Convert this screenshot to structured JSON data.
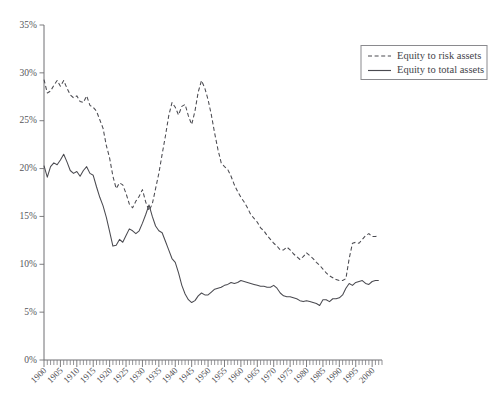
{
  "chart_data": {
    "type": "line",
    "title": "",
    "xlabel": "",
    "ylabel": "",
    "grid": false,
    "legend_position": "top-right",
    "xlim": [
      1900,
      2003
    ],
    "ylim": [
      0,
      35
    ],
    "y_ticks": [
      0,
      5,
      10,
      15,
      20,
      25,
      30,
      35
    ],
    "y_tick_labels": [
      "0%",
      "5%",
      "10%",
      "15%",
      "20%",
      "25%",
      "30%",
      "35%"
    ],
    "x_ticks": [
      1900,
      1905,
      1910,
      1915,
      1920,
      1925,
      1930,
      1935,
      1940,
      1945,
      1950,
      1955,
      1960,
      1965,
      1970,
      1975,
      1980,
      1985,
      1990,
      1995,
      2000
    ],
    "x_tick_labels": [
      "1900",
      "1905",
      "1910",
      "1915",
      "1920",
      "1925",
      "1930",
      "1935",
      "1940",
      "1945",
      "1950",
      "1955",
      "1960",
      "1965",
      "1970",
      "1975",
      "1980",
      "1985",
      "1990",
      "1995",
      "2000"
    ],
    "x_minor_tick_step": 1,
    "series": [
      {
        "name": "Equity to risk assets",
        "style": "dashed",
        "color": "#4a4a50",
        "x": [
          1900,
          1901,
          1902,
          1903,
          1904,
          1905,
          1906,
          1907,
          1908,
          1909,
          1910,
          1911,
          1912,
          1913,
          1914,
          1915,
          1916,
          1917,
          1918,
          1919,
          1920,
          1921,
          1922,
          1923,
          1924,
          1925,
          1926,
          1927,
          1928,
          1929,
          1930,
          1931,
          1932,
          1933,
          1934,
          1935,
          1936,
          1937,
          1938,
          1939,
          1940,
          1941,
          1942,
          1943,
          1944,
          1945,
          1946,
          1947,
          1948,
          1949,
          1950,
          1951,
          1952,
          1953,
          1954,
          1955,
          1956,
          1957,
          1958,
          1959,
          1960,
          1961,
          1962,
          1963,
          1964,
          1965,
          1966,
          1967,
          1968,
          1969,
          1970,
          1971,
          1972,
          1973,
          1974,
          1975,
          1976,
          1977,
          1978,
          1979,
          1980,
          1981,
          1982,
          1983,
          1984,
          1985,
          1986,
          1987,
          1988,
          1989,
          1990,
          1991,
          1992,
          1993,
          1994,
          1995,
          1996,
          1997,
          1998,
          1999,
          2000,
          2001,
          2002
        ],
        "values": [
          29.3,
          27.9,
          28.1,
          28.7,
          29.2,
          28.6,
          29.2,
          28.4,
          27.7,
          27.4,
          27.6,
          27.0,
          26.9,
          27.6,
          26.6,
          26.4,
          26.0,
          25.1,
          24.2,
          22.4,
          21.1,
          19.2,
          17.9,
          18.5,
          18.3,
          17.4,
          16.3,
          15.9,
          16.6,
          17.1,
          17.8,
          16.5,
          15.6,
          16.3,
          17.9,
          19.5,
          21.5,
          23.4,
          25.5,
          26.9,
          26.4,
          25.6,
          26.5,
          26.7,
          25.5,
          24.6,
          26.0,
          28.0,
          29.2,
          28.4,
          27.2,
          25.6,
          23.7,
          22.0,
          20.6,
          20.2,
          19.9,
          19.2,
          18.3,
          17.6,
          17.0,
          16.5,
          15.9,
          15.2,
          14.8,
          14.4,
          13.8,
          13.5,
          13.0,
          12.6,
          12.2,
          11.9,
          11.5,
          11.5,
          11.8,
          11.5,
          11.1,
          10.8,
          10.5,
          10.8,
          11.2,
          10.9,
          10.6,
          10.2,
          9.9,
          9.5,
          9.1,
          8.8,
          8.6,
          8.4,
          8.3,
          8.3,
          8.5,
          10.6,
          12.2,
          12.3,
          12.2,
          12.6,
          13.0,
          13.2,
          12.9,
          12.9,
          13.0
        ]
      },
      {
        "name": "Equity to total assets",
        "style": "solid",
        "color": "#4a4a50",
        "x": [
          1900,
          1901,
          1902,
          1903,
          1904,
          1905,
          1906,
          1907,
          1908,
          1909,
          1910,
          1911,
          1912,
          1913,
          1914,
          1915,
          1916,
          1917,
          1918,
          1919,
          1920,
          1921,
          1922,
          1923,
          1924,
          1925,
          1926,
          1927,
          1928,
          1929,
          1930,
          1931,
          1932,
          1933,
          1934,
          1935,
          1936,
          1937,
          1938,
          1939,
          1940,
          1941,
          1942,
          1943,
          1944,
          1945,
          1946,
          1947,
          1948,
          1949,
          1950,
          1951,
          1952,
          1953,
          1954,
          1955,
          1956,
          1957,
          1958,
          1959,
          1960,
          1961,
          1962,
          1963,
          1964,
          1965,
          1966,
          1967,
          1968,
          1969,
          1970,
          1971,
          1972,
          1973,
          1974,
          1975,
          1976,
          1977,
          1978,
          1979,
          1980,
          1981,
          1982,
          1983,
          1984,
          1985,
          1986,
          1987,
          1988,
          1989,
          1990,
          1991,
          1992,
          1993,
          1994,
          1995,
          1996,
          1997,
          1998,
          1999,
          2000,
          2001,
          2002
        ],
        "values": [
          20.3,
          19.1,
          20.2,
          20.6,
          20.4,
          20.9,
          21.5,
          20.7,
          19.8,
          19.5,
          19.7,
          19.2,
          19.8,
          20.2,
          19.5,
          19.3,
          18.1,
          17.0,
          16.1,
          14.9,
          13.4,
          11.9,
          12.0,
          12.6,
          12.3,
          13.0,
          13.7,
          13.5,
          13.2,
          13.5,
          14.3,
          15.2,
          16.2,
          15.0,
          14.0,
          13.5,
          13.3,
          12.4,
          11.5,
          10.6,
          10.2,
          9.1,
          7.8,
          6.9,
          6.3,
          6.0,
          6.2,
          6.7,
          7.0,
          6.8,
          6.8,
          7.1,
          7.4,
          7.5,
          7.6,
          7.8,
          7.9,
          8.1,
          8.0,
          8.1,
          8.3,
          8.2,
          8.1,
          8.0,
          7.9,
          7.8,
          7.7,
          7.7,
          7.6,
          7.6,
          7.8,
          7.5,
          7.0,
          6.7,
          6.6,
          6.6,
          6.5,
          6.4,
          6.2,
          6.1,
          6.2,
          6.1,
          6.0,
          5.9,
          5.7,
          6.3,
          6.3,
          6.1,
          6.4,
          6.4,
          6.5,
          6.8,
          7.5,
          8.0,
          7.8,
          8.1,
          8.2,
          8.3,
          8.0,
          7.9,
          8.2,
          8.3,
          8.3
        ]
      }
    ]
  },
  "legend": {
    "items": [
      {
        "label": "Equity to risk assets",
        "style": "dashed"
      },
      {
        "label": "Equity to total assets",
        "style": "solid"
      }
    ]
  }
}
